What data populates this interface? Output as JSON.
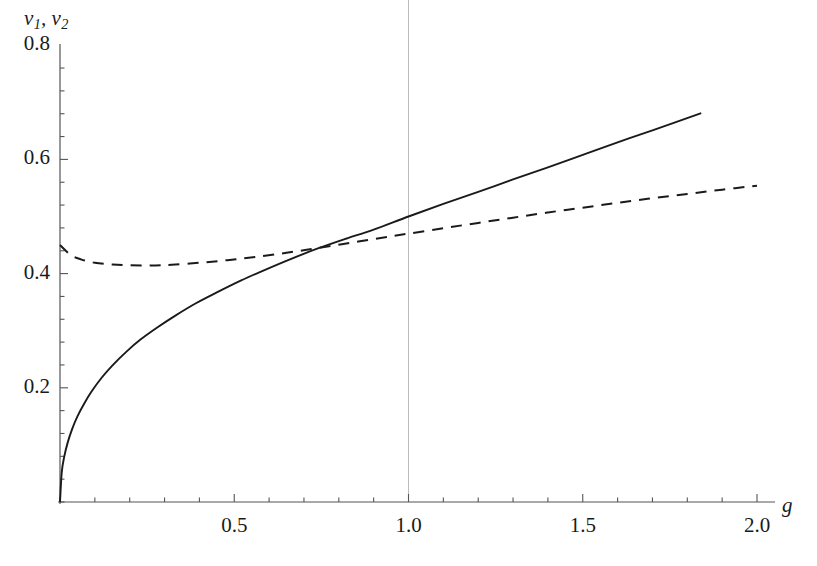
{
  "figure": {
    "background": "#ffffff",
    "axis_color": "#555555",
    "curve_color": "#1a1a1a",
    "gridline_color": "#bbbbbb"
  },
  "labels": {
    "ylabel_v": "v",
    "ylabel_sub1": "1",
    "ylabel_comma": ", ",
    "ylabel_v2": "v",
    "ylabel_sub2": "2",
    "ylabel_full": "v1, v2",
    "xlabel": "g"
  },
  "chart_data": {
    "type": "line",
    "title": "",
    "xlabel": "g",
    "ylabel": "v1, v2",
    "xlim": [
      0,
      2.12
    ],
    "ylim": [
      0,
      0.87
    ],
    "grid": false,
    "legend": "none",
    "x_ticks_major": [
      "0.5",
      "1.0",
      "1.5",
      "2.0"
    ],
    "x_ticks_major_values": [
      0.5,
      1.0,
      1.5,
      2.0
    ],
    "y_ticks_major": [
      "0.2",
      "0.4",
      "0.6",
      "0.8"
    ],
    "y_ticks_major_values": [
      0.2,
      0.4,
      0.6,
      0.8
    ],
    "minor_ticks_per_interval": 4,
    "annotations": [
      {
        "label": "vertical gridline at g = 1.0",
        "x": 1.0
      }
    ],
    "intersection": {
      "x": 1.0,
      "y": 0.5
    },
    "series": [
      {
        "name": "v1",
        "style": "solid",
        "color": "#1a1a1a",
        "x": [
          0.0,
          0.005,
          0.012,
          0.022,
          0.035,
          0.05,
          0.07,
          0.09,
          0.12,
          0.15,
          0.19,
          0.23,
          0.28,
          0.33,
          0.39,
          0.45,
          0.52,
          0.59,
          0.66,
          0.74,
          0.82,
          0.9,
          1.0,
          1.1,
          1.2,
          1.3,
          1.4,
          1.5,
          1.6,
          1.7,
          1.84
        ],
        "y": [
          0.0,
          0.052,
          0.079,
          0.104,
          0.128,
          0.15,
          0.173,
          0.193,
          0.218,
          0.239,
          0.263,
          0.284,
          0.306,
          0.326,
          0.348,
          0.367,
          0.388,
          0.407,
          0.425,
          0.444,
          0.461,
          0.477,
          0.5,
          0.522,
          0.543,
          0.565,
          0.586,
          0.608,
          0.63,
          0.651,
          0.681
        ]
      },
      {
        "name": "v2",
        "style": "dashed",
        "color": "#1a1a1a",
        "dash_pattern": "11 8",
        "x": [
          0.0,
          0.03,
          0.06,
          0.1,
          0.15,
          0.2,
          0.26,
          0.32,
          0.4,
          0.48,
          0.56,
          0.65,
          0.74,
          0.83,
          0.92,
          1.0,
          1.1,
          1.2,
          1.3,
          1.4,
          1.5,
          1.6,
          1.7,
          1.8,
          1.9,
          2.0
        ],
        "y": [
          0.45,
          0.433,
          0.425,
          0.419,
          0.416,
          0.4145,
          0.4142,
          0.4155,
          0.419,
          0.4235,
          0.429,
          0.4365,
          0.4448,
          0.4535,
          0.4625,
          0.47,
          0.4795,
          0.4888,
          0.498,
          0.507,
          0.5155,
          0.524,
          0.532,
          0.5395,
          0.547,
          0.554
        ]
      }
    ]
  }
}
